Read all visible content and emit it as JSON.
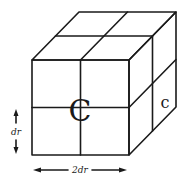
{
  "diagram": {
    "labels": {
      "center_front": "C",
      "center_right": "c",
      "vertical_dimension": "dr",
      "horizontal_dimension": "2dr"
    },
    "colors": {
      "stroke": "#1a1a1a",
      "background": "#ffffff"
    }
  }
}
